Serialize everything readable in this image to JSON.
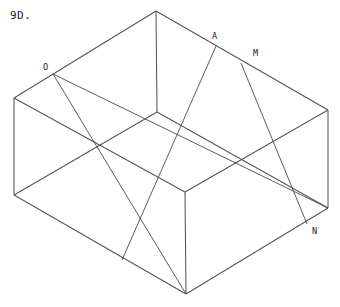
{
  "figure": {
    "caption": "9D.",
    "background_color": "#ffffff",
    "line_color": "#4a4a4a",
    "text_color": "#1a1a1a",
    "width": 340,
    "height": 307,
    "labels": [
      {
        "id": "O",
        "text": "O",
        "x": 44,
        "y": 68
      },
      {
        "id": "A",
        "text": "A",
        "x": 213,
        "y": 37
      },
      {
        "id": "M",
        "text": "M",
        "x": 254,
        "y": 54
      },
      {
        "id": "N",
        "text": "N",
        "x": 313,
        "y": 232
      }
    ],
    "vertices": {
      "top_apex": [
        156,
        11
      ],
      "left_top": [
        14,
        98
      ],
      "left_bottom": [
        14,
        195
      ],
      "right_top": [
        328,
        110
      ],
      "right_bottom": [
        328,
        208
      ],
      "bottom_apex": [
        186,
        294
      ],
      "center_top": [
        157,
        112
      ],
      "center_bottom": [
        185,
        192
      ],
      "point_O": [
        53,
        74
      ],
      "point_A": [
        216,
        46
      ],
      "point_M": [
        241,
        63
      ],
      "point_N": [
        307,
        224
      ]
    },
    "edges": [
      {
        "name": "top-left-ridge",
        "from": [
          156,
          11
        ],
        "to": [
          14,
          98
        ]
      },
      {
        "name": "top-right-ridge",
        "from": [
          156,
          11
        ],
        "to": [
          328,
          110
        ]
      },
      {
        "name": "center-vertical",
        "from": [
          156,
          11
        ],
        "to": [
          157,
          112
        ]
      },
      {
        "name": "left-vertical",
        "from": [
          14,
          98
        ],
        "to": [
          14,
          195
        ]
      },
      {
        "name": "right-vertical",
        "from": [
          328,
          110
        ],
        "to": [
          328,
          208
        ]
      },
      {
        "name": "bottom-left-ridge",
        "from": [
          14,
          195
        ],
        "to": [
          186,
          294
        ]
      },
      {
        "name": "bottom-right-ridge",
        "from": [
          328,
          208
        ],
        "to": [
          186,
          294
        ]
      },
      {
        "name": "bottom-vertical",
        "from": [
          186,
          294
        ],
        "to": [
          185,
          192
        ]
      },
      {
        "name": "inner-left-edge",
        "from": [
          157,
          112
        ],
        "to": [
          14,
          195
        ]
      },
      {
        "name": "inner-right-edge",
        "from": [
          157,
          112
        ],
        "to": [
          328,
          208
        ]
      },
      {
        "name": "inner-floor-left",
        "from": [
          185,
          192
        ],
        "to": [
          14,
          98
        ]
      },
      {
        "name": "inner-floor-right",
        "from": [
          185,
          192
        ],
        "to": [
          328,
          110
        ]
      }
    ],
    "diagonals": [
      {
        "name": "O-to-inner-bottom",
        "from": [
          53,
          74
        ],
        "to": [
          186,
          294
        ]
      },
      {
        "name": "O-to-right-lower",
        "from": [
          53,
          74
        ],
        "to": [
          328,
          208
        ]
      },
      {
        "name": "A-to-bottom-floor",
        "from": [
          216,
          46
        ],
        "to": [
          122,
          260
        ]
      },
      {
        "name": "M-to-N",
        "from": [
          241,
          63
        ],
        "to": [
          307,
          224
        ]
      }
    ]
  }
}
